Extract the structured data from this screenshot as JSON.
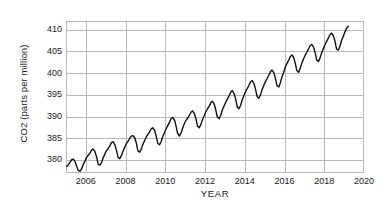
{
  "chart_data": {
    "type": "line",
    "title": "",
    "xlabel": "YEAR",
    "ylabel": "CO2 (parts per million)",
    "xlim": [
      2005.0,
      2020.0
    ],
    "ylim": [
      377.0,
      412.0
    ],
    "grid": true,
    "legend": null,
    "x_ticks": [
      "2006",
      "2008",
      "2010",
      "2012",
      "2014",
      "2016",
      "2018",
      "2020"
    ],
    "x_tick_values": [
      2006,
      2008,
      2010,
      2012,
      2014,
      2016,
      2018,
      2020
    ],
    "y_ticks": [
      "380",
      "385",
      "390",
      "395",
      "400",
      "405",
      "410"
    ],
    "y_tick_values": [
      380,
      385,
      390,
      395,
      400,
      405,
      410
    ],
    "line_color": "#111111",
    "grid_color": "#b9b9b9",
    "series": [
      {
        "name": "Monthly mean CO2",
        "x": [
          2005.04,
          2005.12,
          2005.21,
          2005.29,
          2005.37,
          2005.46,
          2005.54,
          2005.62,
          2005.71,
          2005.79,
          2005.87,
          2005.96,
          2006.04,
          2006.12,
          2006.21,
          2006.29,
          2006.37,
          2006.46,
          2006.54,
          2006.62,
          2006.71,
          2006.79,
          2006.87,
          2006.96,
          2007.04,
          2007.12,
          2007.21,
          2007.29,
          2007.37,
          2007.46,
          2007.54,
          2007.62,
          2007.71,
          2007.79,
          2007.87,
          2007.96,
          2008.04,
          2008.12,
          2008.21,
          2008.29,
          2008.37,
          2008.46,
          2008.54,
          2008.62,
          2008.71,
          2008.79,
          2008.87,
          2008.96,
          2009.04,
          2009.12,
          2009.21,
          2009.29,
          2009.37,
          2009.46,
          2009.54,
          2009.62,
          2009.71,
          2009.79,
          2009.87,
          2009.96,
          2010.04,
          2010.12,
          2010.21,
          2010.29,
          2010.37,
          2010.46,
          2010.54,
          2010.62,
          2010.71,
          2010.79,
          2010.87,
          2010.96,
          2011.04,
          2011.12,
          2011.21,
          2011.29,
          2011.37,
          2011.46,
          2011.54,
          2011.62,
          2011.71,
          2011.79,
          2011.87,
          2011.96,
          2012.04,
          2012.12,
          2012.21,
          2012.29,
          2012.37,
          2012.46,
          2012.54,
          2012.62,
          2012.71,
          2012.79,
          2012.87,
          2012.96,
          2013.04,
          2013.12,
          2013.21,
          2013.29,
          2013.37,
          2013.46,
          2013.54,
          2013.62,
          2013.71,
          2013.79,
          2013.87,
          2013.96,
          2014.04,
          2014.12,
          2014.21,
          2014.29,
          2014.37,
          2014.46,
          2014.54,
          2014.62,
          2014.71,
          2014.79,
          2014.87,
          2014.96,
          2015.04,
          2015.12,
          2015.21,
          2015.29,
          2015.37,
          2015.46,
          2015.54,
          2015.62,
          2015.71,
          2015.79,
          2015.87,
          2015.96,
          2016.04,
          2016.12,
          2016.21,
          2016.29,
          2016.37,
          2016.46,
          2016.54,
          2016.62,
          2016.71,
          2016.79,
          2016.87,
          2016.96,
          2017.04,
          2017.12,
          2017.21,
          2017.29,
          2017.37,
          2017.46,
          2017.54,
          2017.62,
          2017.71,
          2017.79,
          2017.87,
          2017.96,
          2018.04,
          2018.12,
          2018.21,
          2018.29,
          2018.37,
          2018.46,
          2018.54,
          2018.62,
          2018.71,
          2018.79,
          2018.87,
          2018.96,
          2019.04,
          2019.12,
          2019.21
        ],
        "y": [
          378.5,
          378.9,
          379.5,
          380.1,
          380.2,
          379.6,
          378.5,
          377.6,
          377.4,
          378.0,
          379.0,
          379.8,
          380.6,
          381.1,
          381.6,
          382.3,
          382.5,
          381.9,
          380.7,
          379.0,
          378.8,
          379.4,
          380.5,
          381.4,
          382.2,
          382.6,
          383.3,
          384.0,
          384.2,
          383.5,
          382.2,
          380.6,
          380.3,
          381.0,
          382.0,
          383.0,
          383.8,
          384.3,
          385.0,
          385.5,
          385.6,
          385.1,
          383.9,
          382.1,
          381.8,
          382.5,
          383.6,
          384.5,
          385.3,
          385.9,
          386.5,
          387.2,
          387.4,
          386.8,
          385.5,
          383.8,
          383.5,
          384.2,
          385.4,
          386.3,
          387.2,
          387.9,
          388.7,
          389.5,
          389.8,
          389.2,
          387.8,
          386.1,
          385.5,
          386.2,
          387.3,
          388.4,
          389.1,
          389.6,
          390.3,
          391.0,
          391.3,
          390.7,
          389.5,
          387.8,
          387.4,
          388.2,
          389.3,
          390.2,
          391.1,
          391.8,
          392.4,
          393.2,
          393.5,
          392.9,
          391.5,
          389.9,
          389.5,
          390.3,
          391.5,
          392.5,
          393.3,
          394.0,
          394.8,
          395.6,
          396.0,
          395.3,
          394.0,
          392.2,
          391.8,
          392.6,
          393.8,
          394.9,
          395.8,
          396.4,
          397.2,
          398.0,
          398.3,
          397.6,
          396.3,
          394.6,
          394.2,
          395.0,
          396.2,
          397.2,
          398.1,
          398.7,
          399.5,
          400.3,
          400.7,
          400.1,
          398.8,
          397.1,
          396.8,
          397.8,
          399.1,
          400.2,
          401.4,
          402.2,
          403.0,
          403.8,
          404.2,
          403.6,
          402.3,
          400.6,
          400.2,
          401.1,
          402.3,
          403.3,
          404.1,
          404.8,
          405.6,
          406.3,
          406.6,
          406.0,
          404.7,
          403.0,
          402.7,
          403.5,
          404.7,
          405.7,
          406.6,
          407.3,
          408.1,
          408.9,
          409.2,
          408.6,
          407.3,
          405.5,
          405.3,
          406.2,
          407.5,
          408.5,
          409.5,
          410.3,
          410.8
        ]
      }
    ]
  },
  "axes": {
    "ylabel_text": "CO2 (parts per million)",
    "xlabel_text": "YEAR"
  }
}
